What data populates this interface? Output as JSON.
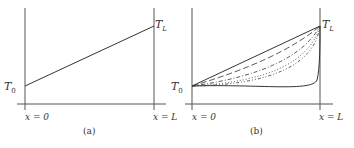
{
  "panels": [
    {
      "id": "a",
      "caption": "(a)",
      "left_temp_label": "T",
      "left_temp_sub": "0",
      "right_temp_label": "T",
      "right_temp_sub": "L",
      "x_left_label": "x = 0",
      "x_right_label": "x = L",
      "curves": [
        "linear"
      ]
    },
    {
      "id": "b",
      "caption": "(b)",
      "left_temp_label": "T",
      "left_temp_sub": "0",
      "right_temp_label": "T",
      "right_temp_sub": "L",
      "x_left_label": "x = 0",
      "x_right_label": "x = L",
      "curves": [
        "solid-linear",
        "dashed",
        "dash-dot",
        "dotted",
        "dash-dot-dot",
        "solid-steep"
      ]
    }
  ],
  "colors": {
    "line": "#333333",
    "axis": "#555555"
  }
}
